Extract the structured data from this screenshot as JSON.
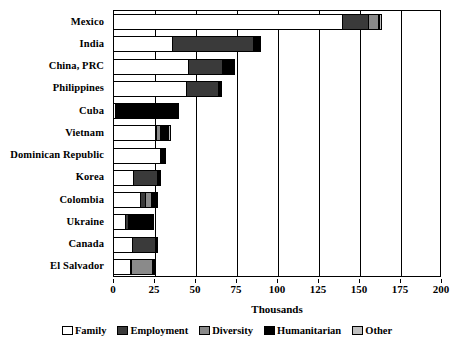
{
  "chart_data": {
    "type": "bar",
    "orientation": "horizontal",
    "stacked": true,
    "title": "",
    "xlabel": "Thousands",
    "ylabel": "",
    "xlim": [
      0,
      200
    ],
    "xticks": [
      0,
      25,
      50,
      75,
      100,
      125,
      150,
      175,
      200
    ],
    "xtick_labels": [
      "0",
      "25",
      "50",
      "75",
      "100",
      "125",
      "150",
      "175",
      "200"
    ],
    "grid": true,
    "grid_axis": "x",
    "legend_position": "bottom",
    "categories": [
      "Mexico",
      "India",
      "China, PRC",
      "Philippines",
      "Cuba",
      "Vietnam",
      "Dominican Republic",
      "Korea",
      "Colombia",
      "Ukraine",
      "Canada",
      "El Salvador"
    ],
    "series": [
      {
        "name": "Family",
        "color": "#ffffff",
        "values": [
          139.5,
          36.0,
          45.5,
          44.5,
          1.0,
          25.5,
          28.5,
          12.0,
          16.5,
          7.5,
          11.5,
          10.5
        ]
      },
      {
        "name": "Employment",
        "color": "#3a3a3a",
        "values": [
          16.0,
          49.5,
          21.0,
          19.5,
          0.5,
          0.5,
          0.5,
          15.0,
          3.0,
          1.5,
          14.0,
          0.5
        ]
      },
      {
        "name": "Diversity",
        "color": "#8a8a8a",
        "values": [
          6.0,
          0.5,
          0.5,
          0.5,
          0.5,
          2.5,
          0.5,
          0.5,
          3.5,
          1.0,
          0.5,
          13.0
        ]
      },
      {
        "name": "Humanitarian",
        "color": "#000000",
        "values": [
          0.5,
          3.0,
          6.0,
          0.5,
          37.0,
          5.0,
          1.5,
          0.5,
          3.0,
          13.5,
          0.5,
          0.5
        ]
      },
      {
        "name": "Other",
        "color": "#c0c0c0",
        "values": [
          1.5,
          0.5,
          0.5,
          0.5,
          0.5,
          1.0,
          0.5,
          0.5,
          0.5,
          0.5,
          0.5,
          0.5
        ]
      }
    ],
    "totals": [
      163.5,
      89.5,
      73.5,
      65.5,
      39.5,
      34.5,
      31.5,
      28.5,
      26.5,
      24.0,
      27.0,
      25.0
    ]
  },
  "legend": {
    "items": [
      {
        "label": "Family",
        "color": "#ffffff"
      },
      {
        "label": "Employment",
        "color": "#3a3a3a"
      },
      {
        "label": "Diversity",
        "color": "#8a8a8a"
      },
      {
        "label": "Humanitarian",
        "color": "#000000"
      },
      {
        "label": "Other",
        "color": "#c0c0c0"
      }
    ]
  }
}
